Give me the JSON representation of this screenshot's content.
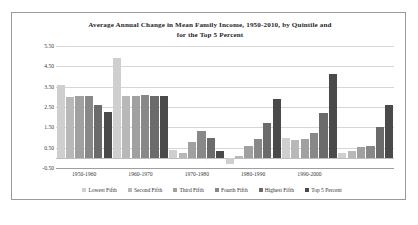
{
  "figure": {
    "title_line1": "Average Annual Change in Mean Family Income, 1950-2010, by Quintile and",
    "title_line2": "for the Top 5 Percent"
  },
  "chart_data": {
    "type": "bar",
    "title": "Average Annual Change in Mean Family Income, 1950-2010, by Quintile and for the Top 5 Percent",
    "xlabel": "",
    "ylabel": "",
    "ylim": [
      -0.5,
      5.5
    ],
    "ytick_labels": [
      "5.50",
      "4.50",
      "3.50",
      "2.50",
      "1.50",
      "0.50",
      "-0.50"
    ],
    "ytick_values": [
      5.5,
      4.5,
      3.5,
      2.5,
      1.5,
      0.5,
      -0.5
    ],
    "grid": true,
    "legend_position": "bottom",
    "categories": [
      "1950-1960",
      "1960-1970",
      "1970-1980",
      "1980-1990",
      "1990-2000",
      "2000-2010"
    ],
    "series": [
      {
        "name": "Lowest Fifth",
        "color": "#cfcfcf",
        "values": [
          3.6,
          4.9,
          0.4,
          -0.3,
          1.0,
          0.25
        ]
      },
      {
        "name": "Second Fifth",
        "color": "#b8b8b8",
        "values": [
          3.0,
          3.05,
          0.25,
          0.1,
          0.9,
          0.35
        ]
      },
      {
        "name": "Third Fifth",
        "color": "#a0a0a0",
        "values": [
          3.05,
          3.05,
          0.8,
          0.6,
          0.95,
          0.55
        ]
      },
      {
        "name": "Fourth Fifth",
        "color": "#888888",
        "values": [
          3.05,
          3.1,
          1.3,
          0.95,
          1.2,
          0.6
        ]
      },
      {
        "name": "Highest Fifth",
        "color": "#6b6b6b",
        "values": [
          2.6,
          3.05,
          1.0,
          1.7,
          2.2,
          1.5
        ]
      },
      {
        "name": "Top 5 Percent",
        "color": "#4a4a4a",
        "values": [
          2.25,
          3.05,
          0.35,
          2.9,
          4.1,
          2.6
        ]
      }
    ]
  }
}
